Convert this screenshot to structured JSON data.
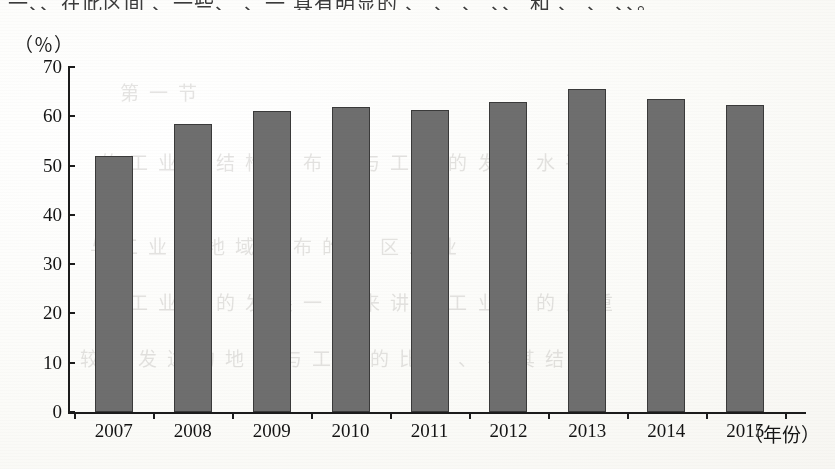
{
  "page": {
    "top_cut_text": "一、、在此区间 、一些、 、一 具有明显的 、 、 、 、、 和 、 、 、、。",
    "ghost_text_lines": [
      "第 一 节",
      "的 工 业 的 结 构 、 布 局 与 工 业 的 发 展 水 平",
      "与 工 业 的 地 域 分 布 的 地 区 工 业",
      "的 工 业 化 的 发 展 一 般 来 讲 与 工 业 化 的 比 重",
      "较 为 发 达 的 地 区 与 工 业 的 比 重 、 与 其 结 构"
    ]
  },
  "chart_data": {
    "type": "bar",
    "title": "",
    "xlabel": "（年份）",
    "ylabel": "（％）",
    "categories": [
      "2007",
      "2008",
      "2009",
      "2010",
      "2011",
      "2012",
      "2013",
      "2014",
      "2015"
    ],
    "values": [
      52.0,
      58.5,
      61.0,
      61.8,
      61.3,
      63.0,
      65.5,
      63.5,
      62.3
    ],
    "ylim": [
      0,
      70
    ],
    "ytick_labels": [
      "0",
      "10",
      "20",
      "30",
      "40",
      "50",
      "60",
      "70"
    ],
    "ytick_values": [
      0,
      10,
      20,
      30,
      40,
      50,
      60,
      70
    ],
    "grid": false,
    "legend": null,
    "bar_color": "#6e6e6e",
    "bar_border_color": "#3a3a3a",
    "axis_color": "#1c1c1c",
    "background_color": "#fdfdfb"
  }
}
